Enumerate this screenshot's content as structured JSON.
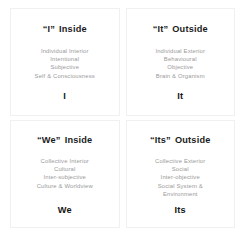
{
  "diagram": {
    "colors": {
      "background": "#ffffff",
      "border": "#f0f0f0",
      "heading_text": "#1b1b1b",
      "body_text": "#9a9a9a",
      "label_text": "#141414"
    },
    "quadrants": [
      {
        "id": "upper-left",
        "pronoun": "“I”",
        "perspective": "Inside",
        "lines": [
          "Individual Interior",
          "Intentional",
          "Subjective",
          "Self & Consciousness"
        ],
        "label": "I"
      },
      {
        "id": "upper-right",
        "pronoun": "“It”",
        "perspective": "Outside",
        "lines": [
          "Individual Exterior",
          "Behavioural",
          "Objective",
          "Brain & Organism"
        ],
        "label": "It"
      },
      {
        "id": "lower-left",
        "pronoun": "“We”",
        "perspective": "Inside",
        "lines": [
          "Collective Interior",
          "Cultural",
          "Inter-subjective",
          "Culture & Worldview"
        ],
        "label": "We"
      },
      {
        "id": "lower-right",
        "pronoun": "“Its”",
        "perspective": "Outside",
        "lines": [
          "Collective Exterior",
          "Social",
          "Inter-objective",
          "Social System &",
          "Environment"
        ],
        "label": "Its"
      }
    ]
  }
}
